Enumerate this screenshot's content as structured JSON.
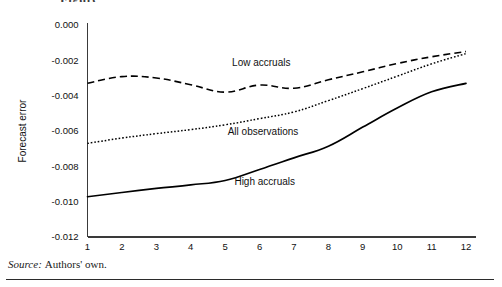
{
  "figure": {
    "title_clipped": "Figure",
    "source_word": "Source:",
    "source_text": "Authors' own."
  },
  "chart_data": {
    "type": "line",
    "title": "",
    "subtitle": "",
    "xlabel": "",
    "ylabel": "Forecast error",
    "x": [
      1,
      2,
      3,
      4,
      5,
      6,
      7,
      8,
      9,
      10,
      11,
      12
    ],
    "xtick_labels": [
      "1",
      "2",
      "3",
      "4",
      "5",
      "6",
      "7",
      "8",
      "9",
      "10",
      "11",
      "12"
    ],
    "ytick_labels": [
      "0.000",
      "-0.002",
      "-0.004",
      "-0.006",
      "-0.008",
      "-0.010",
      "-0.012"
    ],
    "ytick_values": [
      0.0,
      -0.002,
      -0.004,
      -0.006,
      -0.008,
      -0.01,
      -0.012
    ],
    "xlim": [
      1,
      12
    ],
    "ylim": [
      -0.012,
      0.0
    ],
    "grid": false,
    "legend": "inline-annotations",
    "series": [
      {
        "name": "Low accruals",
        "style": "dashed",
        "color": "#000000",
        "label_x": 6.05,
        "label_y": -0.00232,
        "values": [
          -0.0033,
          -0.00292,
          -0.003,
          -0.00338,
          -0.0038,
          -0.0034,
          -0.00358,
          -0.0031,
          -0.00265,
          -0.00218,
          -0.0018,
          -0.0015
        ]
      },
      {
        "name": "All observations",
        "style": "dotted",
        "color": "#000000",
        "label_x": 6.1,
        "label_y": -0.0062,
        "values": [
          -0.0067,
          -0.0064,
          -0.00615,
          -0.00592,
          -0.00565,
          -0.0053,
          -0.00492,
          -0.00428,
          -0.0036,
          -0.0029,
          -0.0022,
          -0.00162
        ]
      },
      {
        "name": "High accruals",
        "style": "solid",
        "color": "#000000",
        "label_x": 6.15,
        "label_y": -0.00905,
        "values": [
          -0.00972,
          -0.00948,
          -0.00925,
          -0.00905,
          -0.0088,
          -0.00818,
          -0.00752,
          -0.00686,
          -0.00578,
          -0.0047,
          -0.00378,
          -0.0033
        ]
      }
    ],
    "annotations": [
      {
        "text": "Low accruals",
        "series": "Low accruals"
      },
      {
        "text": "All observations",
        "series": "All observations"
      },
      {
        "text": "High accruals",
        "series": "High accruals"
      }
    ]
  }
}
